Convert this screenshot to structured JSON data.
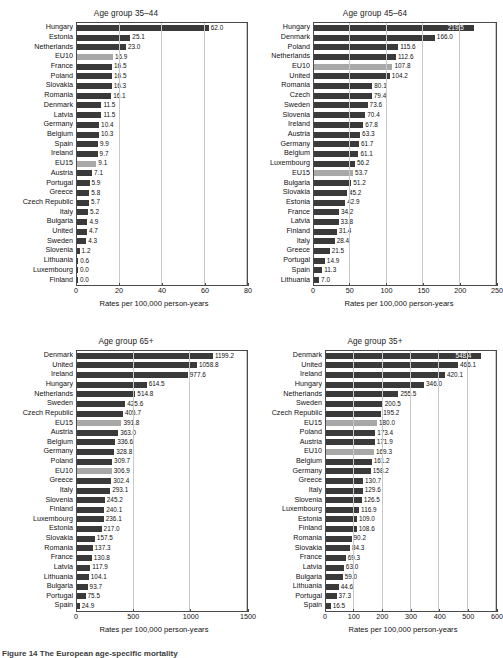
{
  "figure": {
    "caption": "Figure 14 The European age-specific mortality"
  },
  "axis_title": "Rates per 100,000 person-years",
  "colors": {
    "bar_country": "#3a3a3a",
    "bar_aggregate": "#a8a8a8",
    "axis": "#4a4a4a",
    "grid": "#c9c9c9",
    "background": "#ffffff"
  },
  "panels": [
    {
      "id": "age-35-44",
      "title": "Age group 35–44",
      "xlabel": "Rates per 100,000 person-years",
      "xticks": [
        "0",
        "20",
        "40",
        "60",
        "80"
      ],
      "xlim": [
        0,
        80
      ],
      "chart_data": {
        "type": "bar",
        "title": "Age group 35–44",
        "xlabel": "Rates per 100,000 person-years",
        "ylabel": "",
        "xlim": [
          0,
          80
        ],
        "orientation": "horizontal",
        "grid": true,
        "legend": "none",
        "categories": [
          "Hungary",
          "Estonia",
          "Netherlands",
          "EU10",
          "France",
          "Poland",
          "Slovakia",
          "Romania",
          "Denmark",
          "Latvia",
          "Germany",
          "Belgium",
          "Spain",
          "Ireland",
          "EU15",
          "Austria",
          "Portugal",
          "Greece",
          "Czech Republic",
          "Italy",
          "Bulgaria",
          "United",
          "Sweden",
          "Slovenia",
          "Lithuania",
          "Luxembourg",
          "Finland"
        ],
        "values": [
          62.0,
          25.1,
          23.0,
          16.9,
          16.5,
          16.5,
          16.3,
          16.1,
          11.5,
          11.5,
          10.4,
          10.3,
          9.9,
          9.7,
          9.1,
          7.1,
          5.9,
          5.8,
          5.7,
          5.2,
          4.9,
          4.7,
          4.3,
          1.2,
          0.6,
          0.0,
          0.0
        ],
        "labels": [
          "62.0",
          "25.1",
          "23.0",
          "16.9",
          "16.5",
          "16.5",
          "16.3",
          "16.1",
          "11.5",
          "11.5",
          "10.4",
          "10.3",
          "9.9",
          "9.7",
          "9.1",
          "7.1",
          "5.9",
          "5.8",
          "5.7",
          "5.2",
          "4.9",
          "4.7",
          "4.3",
          "1.2",
          "0.6",
          "0.0",
          "0.0"
        ],
        "aggregate_flags": [
          false,
          false,
          false,
          true,
          false,
          false,
          false,
          false,
          false,
          false,
          false,
          false,
          false,
          false,
          true,
          false,
          false,
          false,
          false,
          false,
          false,
          false,
          false,
          false,
          false,
          false,
          false
        ]
      }
    },
    {
      "id": "age-45-64",
      "title": "Age group 45–64",
      "xlabel": "Rates per 100,000 person-years",
      "xticks": [
        "0",
        "50",
        "100",
        "150",
        "200",
        "250"
      ],
      "xlim": [
        0,
        250
      ],
      "chart_data": {
        "type": "bar",
        "title": "Age group 45–64",
        "xlabel": "Rates per 100,000 person-years",
        "ylabel": "",
        "xlim": [
          0,
          250
        ],
        "orientation": "horizontal",
        "grid": true,
        "legend": "none",
        "categories": [
          "Hungary",
          "Denmark",
          "Poland",
          "Netherlands",
          "EU10",
          "United",
          "Romania",
          "Czech",
          "Sweden",
          "Slovenia",
          "Ireland",
          "Austria",
          "Germany",
          "Belgium",
          "Luxembourg",
          "EU15",
          "Bulgaria",
          "Slovakia",
          "Estonia",
          "France",
          "Latvia",
          "Finland",
          "Italy",
          "Greece",
          "Portugal",
          "Spain",
          "Lithuania"
        ],
        "values": [
          219.5,
          166.0,
          115.6,
          112.6,
          107.8,
          104.2,
          80.1,
          79.4,
          73.6,
          70.4,
          67.8,
          63.3,
          61.7,
          61.1,
          56.2,
          53.7,
          51.2,
          45.2,
          42.9,
          34.2,
          33.8,
          31.4,
          28.4,
          21.5,
          14.9,
          11.3,
          7.0
        ],
        "labels": [
          "219.5",
          "166.0",
          "115.6",
          "112.6",
          "107.8",
          "104.2",
          "80.1",
          "79.4",
          "73.6",
          "70.4",
          "67.8",
          "63.3",
          "61.7",
          "61.1",
          "56.2",
          "53.7",
          "51.2",
          "45.2",
          "42.9",
          "34.2",
          "33.8",
          "31.4",
          "28.4",
          "21.5",
          "14.9",
          "11.3",
          "7.0"
        ],
        "aggregate_flags": [
          false,
          false,
          false,
          false,
          true,
          false,
          false,
          false,
          false,
          false,
          false,
          false,
          false,
          false,
          false,
          true,
          false,
          false,
          false,
          false,
          false,
          false,
          false,
          false,
          false,
          false,
          false
        ]
      }
    },
    {
      "id": "age-65-plus",
      "title": "Age group 65+",
      "xlabel": "Rates per 100,000 person-years",
      "xticks": [
        "0",
        "500",
        "1000",
        "1500"
      ],
      "xlim": [
        0,
        1500
      ],
      "chart_data": {
        "type": "bar",
        "title": "Age group 65+",
        "xlabel": "Rates per 100,000 person-years",
        "ylabel": "",
        "xlim": [
          0,
          1500
        ],
        "orientation": "horizontal",
        "grid": true,
        "legend": "none",
        "categories": [
          "Denmark",
          "United",
          "Ireland",
          "Hungary",
          "Netherlands",
          "Sweden",
          "Czech Republic",
          "EU15",
          "Austria",
          "Belgium",
          "Germany",
          "Poland",
          "EU10",
          "Greece",
          "Italy",
          "Slovenia",
          "Finland",
          "Luxembourg",
          "Estonia",
          "Slovakia",
          "Romania",
          "France",
          "Latvia",
          "Lithuania",
          "Bulgaria",
          "Portugal",
          "Spain"
        ],
        "values": [
          1199.2,
          1058.8,
          977.6,
          614.5,
          514.8,
          425.6,
          405.7,
          391.8,
          363.0,
          336.6,
          328.8,
          309.7,
          306.9,
          302.4,
          293.1,
          245.2,
          240.1,
          236.1,
          217.0,
          157.5,
          137.3,
          130.8,
          117.9,
          104.1,
          93.7,
          75.5,
          24.9
        ],
        "labels": [
          "1199.2",
          "1058.8",
          "977.6",
          "614.5",
          "514.8",
          "425.6",
          "405.7",
          "391.8",
          "363.0",
          "336.6",
          "328.8",
          "309.7",
          "306.9",
          "302.4",
          "293.1",
          "245.2",
          "240.1",
          "236.1",
          "217.0",
          "157.5",
          "137.3",
          "130.8",
          "117.9",
          "104.1",
          "93.7",
          "75.5",
          "24.9"
        ],
        "aggregate_flags": [
          false,
          false,
          false,
          false,
          false,
          false,
          false,
          true,
          false,
          false,
          false,
          false,
          true,
          false,
          false,
          false,
          false,
          false,
          false,
          false,
          false,
          false,
          false,
          false,
          false,
          false,
          false
        ]
      }
    },
    {
      "id": "age-35-plus",
      "title": "Age group 35+",
      "xlabel": "Rates per 100,000 person-years",
      "xticks": [
        "0",
        "100",
        "200",
        "300",
        "400",
        "500",
        "600"
      ],
      "xlim": [
        0,
        600
      ],
      "chart_data": {
        "type": "bar",
        "title": "Age group 35+",
        "xlabel": "Rates per 100,000 person-years",
        "ylabel": "",
        "xlim": [
          0,
          600
        ],
        "orientation": "horizontal",
        "grid": true,
        "legend": "none",
        "categories": [
          "Denmark",
          "United",
          "Ireland",
          "Hungary",
          "Netherlands",
          "Sweden",
          "Czech Republic",
          "EU15",
          "Poland",
          "Austria",
          "EU10",
          "Belgium",
          "Germany",
          "Greece",
          "Italy",
          "Slovenia",
          "Luxembourg",
          "Estonia",
          "Finland",
          "Romania",
          "Slovakia",
          "France",
          "Latvia",
          "Bulgaria",
          "Lithuania",
          "Portugal",
          "Spain"
        ],
        "values": [
          548.4,
          466.1,
          420.1,
          346.0,
          255.5,
          200.5,
          195.2,
          180.0,
          173.4,
          171.9,
          169.3,
          161.2,
          158.2,
          130.7,
          129.6,
          126.5,
          116.9,
          109.0,
          108.6,
          90.2,
          84.3,
          69.3,
          63.0,
          59.0,
          44.6,
          37.3,
          16.5
        ],
        "labels": [
          "548.4",
          "466.1",
          "420.1",
          "346.0",
          "255.5",
          "200.5",
          "195.2",
          "180.0",
          "173.4",
          "171.9",
          "169.3",
          "161.2",
          "158.2",
          "130.7",
          "129.6",
          "126.5",
          "116.9",
          "109.0",
          "108.6",
          "90.2",
          "84.3",
          "69.3",
          "63.0",
          "59.0",
          "44.6",
          "37.3",
          "16.5"
        ],
        "aggregate_flags": [
          false,
          false,
          false,
          false,
          false,
          false,
          false,
          true,
          false,
          false,
          true,
          false,
          false,
          false,
          false,
          false,
          false,
          false,
          false,
          false,
          false,
          false,
          false,
          false,
          false,
          false,
          false
        ]
      }
    }
  ]
}
